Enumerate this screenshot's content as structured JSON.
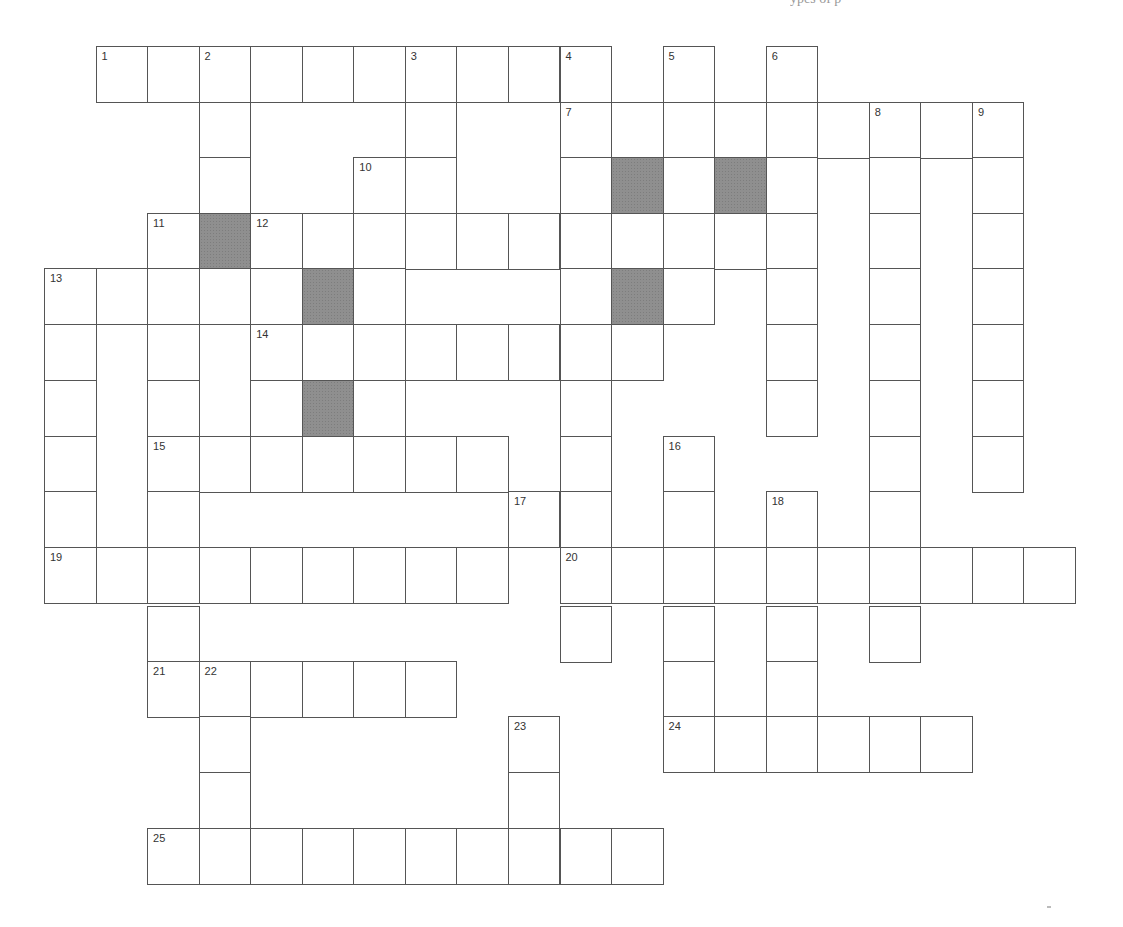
{
  "page": {
    "header_fragment": "ypes of p",
    "cell_size": {
      "width": 51.55,
      "height": 55.6
    },
    "origin": {
      "x": 44,
      "y": 46
    },
    "colors": {
      "border": "#555555",
      "shaded": "#8f8f8f",
      "background": "#ffffff",
      "number": "#333333"
    }
  },
  "crossword": {
    "rows": [
      {
        "row": 0,
        "cells": [
          {
            "c": 1,
            "n": "1"
          },
          {
            "c": 2
          },
          {
            "c": 3,
            "n": "2"
          },
          {
            "c": 4
          },
          {
            "c": 5
          },
          {
            "c": 6
          },
          {
            "c": 7,
            "n": "3"
          },
          {
            "c": 8
          },
          {
            "c": 9
          },
          {
            "c": 10,
            "n": "4"
          },
          {
            "c": 12,
            "n": "5"
          },
          {
            "c": 14,
            "n": "6"
          }
        ]
      },
      {
        "row": 1,
        "cells": [
          {
            "c": 3
          },
          {
            "c": 7
          },
          {
            "c": 10,
            "n": "7"
          },
          {
            "c": 11
          },
          {
            "c": 12
          },
          {
            "c": 13
          },
          {
            "c": 14
          },
          {
            "c": 15
          },
          {
            "c": 16,
            "n": "8"
          },
          {
            "c": 17
          },
          {
            "c": 18,
            "n": "9"
          }
        ]
      },
      {
        "row": 2,
        "cells": [
          {
            "c": 3
          },
          {
            "c": 6,
            "n": "10"
          },
          {
            "c": 7
          },
          {
            "c": 10
          },
          {
            "c": 11,
            "shaded": true
          },
          {
            "c": 12
          },
          {
            "c": 13,
            "shaded": true
          },
          {
            "c": 14
          },
          {
            "c": 16
          },
          {
            "c": 18
          }
        ]
      },
      {
        "row": 3,
        "cells": [
          {
            "c": 2,
            "n": "11"
          },
          {
            "c": 3,
            "shaded": true
          },
          {
            "c": 4,
            "n": "12"
          },
          {
            "c": 5
          },
          {
            "c": 6
          },
          {
            "c": 7
          },
          {
            "c": 8
          },
          {
            "c": 9
          },
          {
            "c": 10
          },
          {
            "c": 11
          },
          {
            "c": 12
          },
          {
            "c": 13
          },
          {
            "c": 14
          },
          {
            "c": 16
          },
          {
            "c": 18
          }
        ]
      },
      {
        "row": 4,
        "cells": [
          {
            "c": 0,
            "n": "13"
          },
          {
            "c": 1
          },
          {
            "c": 2
          },
          {
            "c": 3
          },
          {
            "c": 4
          },
          {
            "c": 5,
            "shaded": true
          },
          {
            "c": 6
          },
          {
            "c": 10
          },
          {
            "c": 11,
            "shaded": true
          },
          {
            "c": 12
          },
          {
            "c": 14
          },
          {
            "c": 16
          },
          {
            "c": 18
          }
        ]
      },
      {
        "row": 5,
        "cells": [
          {
            "c": 0
          },
          {
            "c": 2
          },
          {
            "c": 4,
            "n": "14"
          },
          {
            "c": 5
          },
          {
            "c": 6
          },
          {
            "c": 7
          },
          {
            "c": 8
          },
          {
            "c": 9
          },
          {
            "c": 10
          },
          {
            "c": 11
          },
          {
            "c": 14
          },
          {
            "c": 16
          },
          {
            "c": 18
          }
        ]
      },
      {
        "row": 6,
        "cells": [
          {
            "c": 0
          },
          {
            "c": 2
          },
          {
            "c": 4
          },
          {
            "c": 5,
            "shaded": true
          },
          {
            "c": 6
          },
          {
            "c": 10
          },
          {
            "c": 14
          },
          {
            "c": 16
          },
          {
            "c": 18
          }
        ]
      },
      {
        "row": 7,
        "cells": [
          {
            "c": 0
          },
          {
            "c": 2,
            "n": "15"
          },
          {
            "c": 3
          },
          {
            "c": 4
          },
          {
            "c": 5
          },
          {
            "c": 6
          },
          {
            "c": 7
          },
          {
            "c": 8
          },
          {
            "c": 10
          },
          {
            "c": 12,
            "n": "16"
          },
          {
            "c": 16
          },
          {
            "c": 18
          }
        ]
      },
      {
        "row": 8,
        "cells": [
          {
            "c": 0
          },
          {
            "c": 2
          },
          {
            "c": 9,
            "n": "17"
          },
          {
            "c": 10
          },
          {
            "c": 12
          },
          {
            "c": 14,
            "n": "18"
          },
          {
            "c": 16
          }
        ]
      },
      {
        "row": 9,
        "cells": [
          {
            "c": 0,
            "n": "19"
          },
          {
            "c": 1
          },
          {
            "c": 2
          },
          {
            "c": 3
          },
          {
            "c": 4
          },
          {
            "c": 5
          },
          {
            "c": 6
          },
          {
            "c": 7
          },
          {
            "c": 8
          },
          {
            "c": 10,
            "n": "20"
          },
          {
            "c": 11
          },
          {
            "c": 12
          },
          {
            "c": 13
          },
          {
            "c": 14
          },
          {
            "c": 15
          },
          {
            "c": 16
          },
          {
            "c": 17
          },
          {
            "c": 18
          },
          {
            "c": 19
          }
        ]
      },
      {
        "row": 10,
        "cells": [
          {
            "c": 2
          },
          {
            "c": 10
          },
          {
            "c": 12
          },
          {
            "c": 14
          },
          {
            "c": 16
          }
        ]
      },
      {
        "row": 11,
        "cells": [
          {
            "c": 2,
            "n": "21"
          },
          {
            "c": 3,
            "n": "22"
          },
          {
            "c": 4
          },
          {
            "c": 5
          },
          {
            "c": 6
          },
          {
            "c": 7
          },
          {
            "c": 12
          },
          {
            "c": 14
          }
        ]
      },
      {
        "row": 12,
        "cells": [
          {
            "c": 3
          },
          {
            "c": 9,
            "n": "23"
          },
          {
            "c": 12,
            "n": "24"
          },
          {
            "c": 13
          },
          {
            "c": 14
          },
          {
            "c": 15
          },
          {
            "c": 16
          },
          {
            "c": 17
          }
        ]
      },
      {
        "row": 13,
        "cells": [
          {
            "c": 3
          },
          {
            "c": 9
          }
        ]
      },
      {
        "row": 14,
        "cells": [
          {
            "c": 2,
            "n": "25"
          },
          {
            "c": 3
          },
          {
            "c": 4
          },
          {
            "c": 5
          },
          {
            "c": 6
          },
          {
            "c": 7
          },
          {
            "c": 8
          },
          {
            "c": 9
          },
          {
            "c": 10
          },
          {
            "c": 11
          }
        ]
      }
    ],
    "row_tops": [
      46,
      102,
      157,
      213,
      268,
      324,
      380,
      436,
      491,
      547,
      606,
      661,
      716,
      772,
      828
    ],
    "clue_numbers": [
      "1",
      "2",
      "3",
      "4",
      "5",
      "6",
      "7",
      "8",
      "9",
      "10",
      "11",
      "12",
      "13",
      "14",
      "15",
      "16",
      "17",
      "18",
      "19",
      "20",
      "21",
      "22",
      "23",
      "24",
      "25"
    ]
  }
}
